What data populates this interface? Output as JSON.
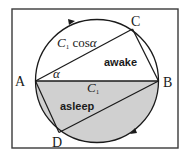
{
  "diagram": {
    "points": {
      "A": {
        "label": "A"
      },
      "B": {
        "label": "B"
      },
      "C": {
        "label": "C"
      },
      "D": {
        "label": "D"
      }
    },
    "labels": {
      "chord_ac_base": "C",
      "chord_ac_sub": "1",
      "chord_ac_rest": " cos",
      "angle": "α",
      "diameter_base": "C",
      "diameter_sub": "1",
      "awake": "awake",
      "asleep": "asleep"
    },
    "colors": {
      "stroke": "#1a1a1a",
      "shade": "#d0d0d0",
      "frame": "#3a3a3a",
      "background": "#ffffff"
    }
  }
}
